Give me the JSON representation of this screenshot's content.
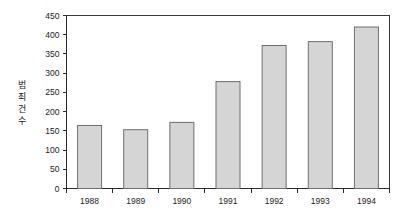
{
  "chart_data": {
    "type": "bar",
    "title": "",
    "subtitle": "",
    "xlabel": "",
    "ylabel": "범죄건수",
    "categories": [
      "1988",
      "1989",
      "1990",
      "1991",
      "1992",
      "1993",
      "1994"
    ],
    "values": [
      164,
      153,
      172,
      278,
      372,
      382,
      420
    ],
    "series": [
      {
        "name": "범죄건수",
        "values": [
          164,
          153,
          172,
          278,
          372,
          382,
          420
        ]
      }
    ],
    "ylim": [
      0,
      450
    ],
    "yticks": [
      0,
      50,
      100,
      150,
      200,
      250,
      300,
      350,
      400,
      450
    ],
    "ytick_labels": [
      "0",
      "50",
      "100",
      "150",
      "200",
      "250",
      "300",
      "350",
      "400",
      "450"
    ],
    "grid": false,
    "legend": false,
    "legend_position": "none",
    "bar_color": "#d5d5d5",
    "bar_border_color": "#6f6f6f",
    "axis_color": "#2b2b2b",
    "background_color": "#ffffff",
    "ylabel_chars": [
      "범",
      "죄",
      "건",
      "수"
    ]
  }
}
